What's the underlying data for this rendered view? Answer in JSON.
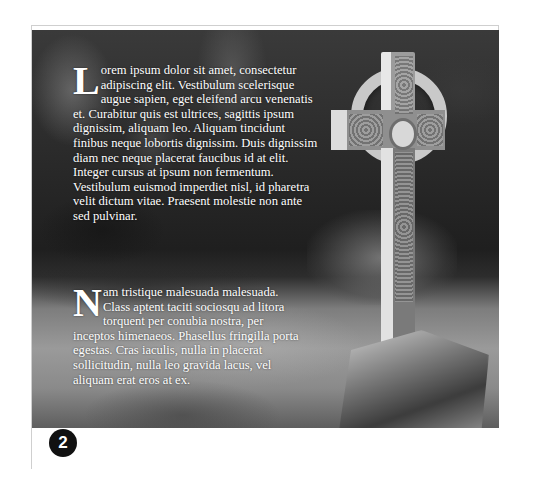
{
  "page": {
    "number": "2",
    "accent_color": "#111111"
  },
  "image": {
    "subject": "stone Celtic cross in a shaded forest clearing",
    "style": "grayscale photograph"
  },
  "paragraphs": [
    {
      "dropcap": "L",
      "text": "orem ipsum dolor sit amet, consectetur adipiscing elit. Vestibulum scelerisque augue sapien, eget eleifend arcu venenatis et. Curabitur quis est ultrices, sagittis ipsum dignissim, aliquam leo. Aliquam tincidunt finibus neque lobortis dignissim. Duis dignissim diam nec neque placerat faucibus id at elit. Integer cursus at ipsum non fermentum. Vestibulum euismod imperdiet nisl, id pharetra velit dictum vitae. Praesent molestie non ante sed pulvinar."
    },
    {
      "dropcap": "N",
      "text": "am tristique malesuada malesuada. Class aptent taciti sociosqu ad litora torquent per conubia nostra, per inceptos himenaeos. Phasellus fringilla porta egestas. Cras iaculis, nulla in placerat sollicitudin, nulla leo gravida lacus, vel aliquam erat eros at ex."
    }
  ]
}
